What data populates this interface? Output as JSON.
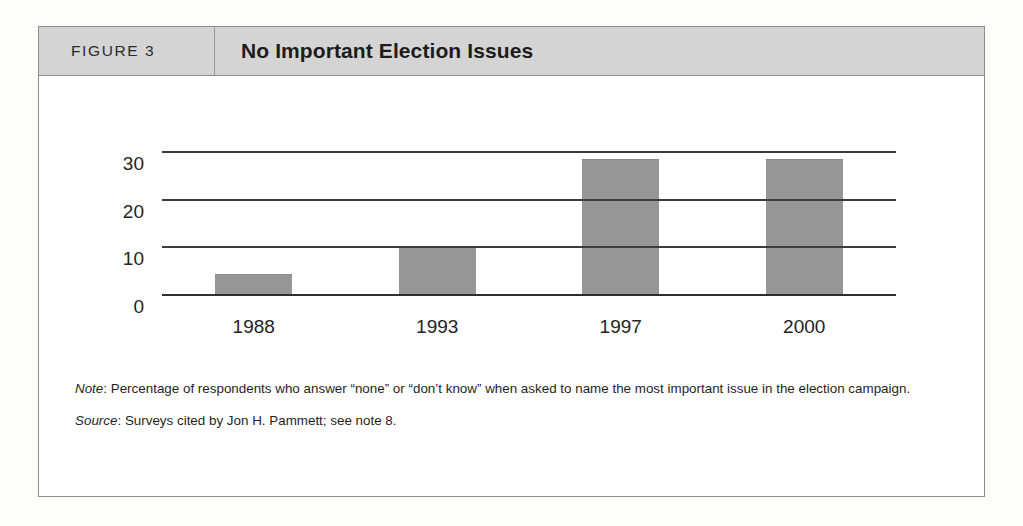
{
  "figure": {
    "number_label": "FIGURE 3",
    "title": "No Important Election Issues"
  },
  "notes": {
    "note_label": "Note",
    "note_text": ": Percentage of respondents who answer “none” or “don’t know” when asked to name the most important issue in the election campaign.",
    "source_label": "Source",
    "source_text": ": Surveys cited by Jon H. Pammett; see note 8."
  },
  "colors": {
    "bar_fill": "#969696",
    "header_band": "#d4d4d4",
    "frame_border": "#8d8d8d",
    "axis": "#3c3c3c"
  },
  "chart_data": {
    "type": "bar",
    "title": "No Important Election Issues",
    "xlabel": "",
    "ylabel": "",
    "categories": [
      "1988",
      "1993",
      "1997",
      "2000"
    ],
    "values": [
      4.5,
      10,
      28.5,
      28.5
    ],
    "ylim": [
      0,
      30
    ],
    "yticks": [
      0,
      10,
      20,
      30
    ],
    "ytick_labels": [
      "0",
      "10",
      "20",
      "30"
    ],
    "grid": true,
    "legend": "none",
    "series": [
      {
        "name": "No important election issues (%)",
        "values": [
          4.5,
          10,
          28.5,
          28.5
        ]
      }
    ]
  }
}
